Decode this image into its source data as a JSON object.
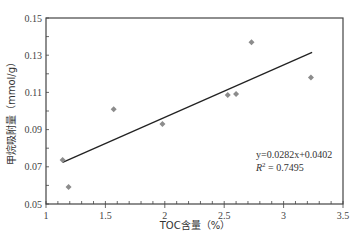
{
  "chart_data": {
    "type": "scatter",
    "title": "",
    "xlabel": "TOC含量（%）",
    "ylabel": "甲烷吸附量（mmol/g）",
    "xlim": [
      1,
      3.5
    ],
    "ylim": [
      0.05,
      0.15
    ],
    "x_ticks": [
      1,
      1.5,
      2,
      2.5,
      3,
      3.5
    ],
    "x_tick_labels": [
      "1",
      "1.5",
      "2",
      "2.5",
      "3",
      "3.5"
    ],
    "y_ticks": [
      0.05,
      0.07,
      0.09,
      0.11,
      0.13,
      0.15
    ],
    "y_tick_labels": [
      "0.05",
      "0.07",
      "0.09",
      "0.11",
      "0.13",
      "0.15"
    ],
    "x_minor_step": 0.1,
    "y_minor_step": 0.01,
    "grid": false,
    "legend": null,
    "series": [
      {
        "name": "samples",
        "marker": "diamond",
        "color": "#8c8c8c",
        "points": [
          {
            "x": 1.14,
            "y": 0.0737
          },
          {
            "x": 1.19,
            "y": 0.0591
          },
          {
            "x": 1.57,
            "y": 0.101
          },
          {
            "x": 1.98,
            "y": 0.093
          },
          {
            "x": 2.53,
            "y": 0.1086
          },
          {
            "x": 2.6,
            "y": 0.1091
          },
          {
            "x": 2.73,
            "y": 0.137
          },
          {
            "x": 3.23,
            "y": 0.118
          }
        ]
      },
      {
        "name": "linear fit",
        "type": "line",
        "color": "#222222",
        "slope": 0.0282,
        "intercept": 0.0402,
        "x_range": [
          1.14,
          3.24
        ]
      }
    ],
    "annotations": {
      "equation": "y=0.0282x+0.0402",
      "r_squared_label": "R",
      "r_squared_sup": "2",
      "r_squared_value": " = 0.7495"
    }
  }
}
